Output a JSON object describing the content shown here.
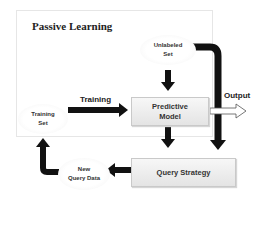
{
  "diagram": {
    "title": "Passive Learning",
    "nodes": {
      "unlabeled_set": {
        "line1": "Unlabeled",
        "line2": "Set"
      },
      "training_set": {
        "line1": "Training",
        "line2": "Set"
      },
      "new_query_data": {
        "line1": "New",
        "line2": "Query Data"
      },
      "predictive_model": {
        "line1": "Predictive",
        "line2": "Model"
      },
      "query_strategy": {
        "label": "Query Strategy"
      }
    },
    "edge_labels": {
      "training": "Training",
      "output": "Output"
    },
    "colors": {
      "arrow": "#111111",
      "frame_border": "#e6e6e6",
      "box_fill_top": "#f7f7f7",
      "box_fill_bottom": "#e4e4e4"
    }
  }
}
